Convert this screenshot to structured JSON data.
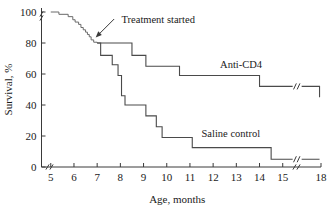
{
  "chart_data": {
    "type": "line",
    "title": "",
    "xlabel": "Age, months",
    "ylabel": "Survival, %",
    "xlim": [
      4.6,
      18
    ],
    "ylim": [
      0,
      100
    ],
    "grid": false,
    "legend_position": "inline-right",
    "x_ticks": [
      "5",
      "6",
      "7",
      "8",
      "9",
      "10",
      "11",
      "12",
      "13",
      "14",
      "15",
      "18"
    ],
    "x_tick_values": [
      5,
      6,
      7,
      8,
      9,
      10,
      11,
      12,
      13,
      14,
      15,
      18
    ],
    "y_ticks": [
      "0",
      "20",
      "40",
      "60",
      "80",
      "100"
    ],
    "y_tick_values": [
      0,
      20,
      40,
      60,
      80,
      100
    ],
    "axis_breaks": {
      "x_axis_break_between": [
        4.75,
        4.95
      ],
      "x_axis_break_between_late": [
        15.4,
        15.9
      ],
      "y_axis_break_near": 97
    },
    "annotations": [
      {
        "text": "Treatment started",
        "points_to_x": 7.0,
        "points_to_y": 80,
        "label_x": 8.05,
        "label_y": 95
      }
    ],
    "series": [
      {
        "name": "Pre-treatment",
        "label": "",
        "step_points": [
          [
            5.0,
            100
          ],
          [
            5.35,
            100
          ],
          [
            5.35,
            98.5
          ],
          [
            5.75,
            98.5
          ],
          [
            5.75,
            97
          ],
          [
            5.95,
            97
          ],
          [
            5.95,
            95
          ],
          [
            6.05,
            95
          ],
          [
            6.05,
            93.5
          ],
          [
            6.2,
            93.5
          ],
          [
            6.2,
            92
          ],
          [
            6.3,
            92
          ],
          [
            6.3,
            90
          ],
          [
            6.4,
            90
          ],
          [
            6.4,
            88.5
          ],
          [
            6.5,
            88.5
          ],
          [
            6.5,
            87
          ],
          [
            6.58,
            87
          ],
          [
            6.58,
            85.5
          ],
          [
            6.66,
            85.5
          ],
          [
            6.66,
            84
          ],
          [
            6.74,
            84
          ],
          [
            6.74,
            82
          ],
          [
            6.85,
            82
          ],
          [
            6.85,
            80.5
          ],
          [
            7.0,
            80.5
          ],
          [
            7.0,
            80
          ]
        ],
        "has_break_at_start": true
      },
      {
        "name": "Anti-CD4",
        "label": "Anti-CD4",
        "label_x": 12.3,
        "label_y": 66,
        "step_points": [
          [
            7.0,
            80
          ],
          [
            8.5,
            80
          ],
          [
            8.5,
            72
          ],
          [
            9.1,
            72
          ],
          [
            9.1,
            65
          ],
          [
            10.55,
            65
          ],
          [
            10.55,
            59
          ],
          [
            14.0,
            59
          ],
          [
            14.0,
            52
          ],
          [
            15.45,
            52
          ],
          [
            16.0,
            52
          ],
          [
            17.85,
            52
          ],
          [
            17.85,
            45
          ]
        ],
        "break_x_range": [
          15.45,
          16.0
        ],
        "final_value": 45
      },
      {
        "name": "Saline control",
        "label": "Saline control",
        "label_x": 11.5,
        "label_y": 21,
        "step_points": [
          [
            7.0,
            80
          ],
          [
            7.15,
            80
          ],
          [
            7.15,
            72
          ],
          [
            7.65,
            72
          ],
          [
            7.65,
            66
          ],
          [
            7.9,
            66
          ],
          [
            7.9,
            59
          ],
          [
            8.05,
            59
          ],
          [
            8.05,
            46
          ],
          [
            8.2,
            46
          ],
          [
            8.2,
            40
          ],
          [
            9.1,
            40
          ],
          [
            9.1,
            33
          ],
          [
            9.55,
            33
          ],
          [
            9.55,
            26
          ],
          [
            9.8,
            26
          ],
          [
            9.8,
            19
          ],
          [
            11.1,
            19
          ],
          [
            11.1,
            12.5
          ],
          [
            14.5,
            12.5
          ],
          [
            14.5,
            5
          ],
          [
            15.45,
            5
          ],
          [
            16.0,
            5
          ],
          [
            17.85,
            5
          ]
        ],
        "break_x_range": [
          15.45,
          16.0
        ],
        "final_value": 5
      }
    ]
  }
}
